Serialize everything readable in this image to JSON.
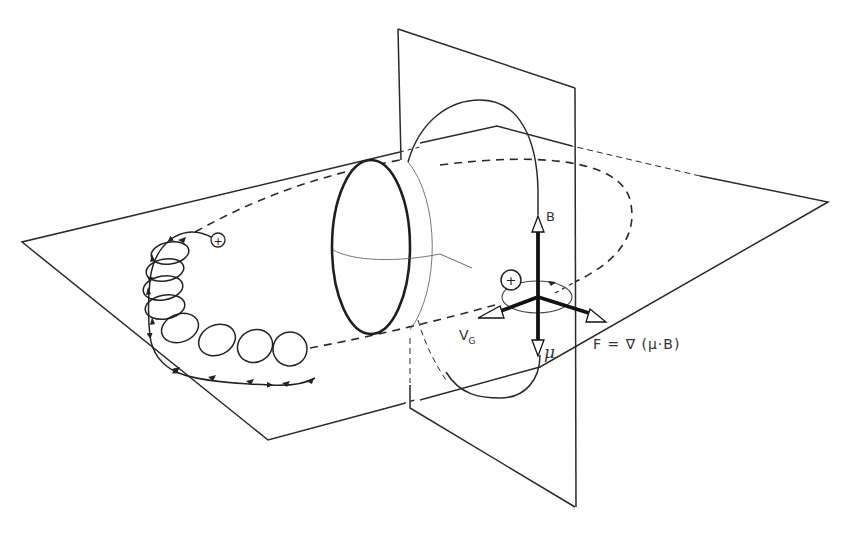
{
  "figure": {
    "colors": {
      "line": "#2a2a2a",
      "background": "#ffffff"
    }
  },
  "labels": {
    "B": "B",
    "mu": "μ",
    "vg_main": "V",
    "vg_sub": "G",
    "force": "F = ∇  (μ·B)",
    "charge_gyrating": "+",
    "charge_guiding": "+"
  },
  "elements": {
    "horizontal_plane": "equatorial-plane",
    "vertical_plane": "meridian-plane",
    "sphere": "planet-sphere",
    "orbit": "drift-orbit-dashed",
    "helix": "gyration-helix",
    "field_line": "dipole-field-line",
    "vectors": [
      "B-vector",
      "mu-vector",
      "vg-vector",
      "force-vector"
    ]
  }
}
